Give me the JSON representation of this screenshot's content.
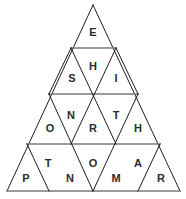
{
  "puzzle": {
    "title": "Triangle Letter Grid",
    "shape": "equilateral-triangle",
    "row_count": 4,
    "cell_count": 16,
    "colors": {
      "background": "#ffffff",
      "edge": "#1d1d1d",
      "divider": "#7a7a7a",
      "letter": "#2b2b2b"
    },
    "rows": [
      {
        "index": 1,
        "cells": [
          {
            "id": "r1c1",
            "letter": "E",
            "orientation": "up",
            "cx": 93,
            "cy": 33
          }
        ]
      },
      {
        "index": 2,
        "cells": [
          {
            "id": "r2c1",
            "letter": "S",
            "orientation": "up",
            "cx": 72,
            "cy": 79
          },
          {
            "id": "r2c2",
            "letter": "H",
            "orientation": "down",
            "cx": 93,
            "cy": 67
          },
          {
            "id": "r2c3",
            "letter": "I",
            "orientation": "up",
            "cx": 116,
            "cy": 79
          }
        ]
      },
      {
        "index": 3,
        "cells": [
          {
            "id": "r3c1",
            "letter": "O",
            "orientation": "up",
            "cx": 50,
            "cy": 129
          },
          {
            "id": "r3c2",
            "letter": "N",
            "orientation": "down",
            "cx": 71,
            "cy": 116
          },
          {
            "id": "r3c3",
            "letter": "R",
            "orientation": "up",
            "cx": 93,
            "cy": 129
          },
          {
            "id": "r3c4",
            "letter": "T",
            "orientation": "down",
            "cx": 116,
            "cy": 116
          },
          {
            "id": "r3c5",
            "letter": "H",
            "orientation": "up",
            "cx": 138,
            "cy": 129
          }
        ]
      },
      {
        "index": 4,
        "cells": [
          {
            "id": "r4c1",
            "letter": "P",
            "orientation": "up",
            "cx": 26,
            "cy": 179
          },
          {
            "id": "r4c2",
            "letter": "T",
            "orientation": "down",
            "cx": 48,
            "cy": 164
          },
          {
            "id": "r4c3",
            "letter": "N",
            "orientation": "up",
            "cx": 70,
            "cy": 179
          },
          {
            "id": "r4c4",
            "letter": "O",
            "orientation": "down",
            "cx": 93,
            "cy": 164
          },
          {
            "id": "r4c5",
            "letter": "M",
            "orientation": "up",
            "cx": 116,
            "cy": 179
          },
          {
            "id": "r4c6",
            "letter": "A",
            "orientation": "down",
            "cx": 138,
            "cy": 164
          },
          {
            "id": "r4c7",
            "letter": "R",
            "orientation": "up",
            "cx": 161,
            "cy": 179
          }
        ]
      }
    ],
    "geometry": {
      "apex": {
        "x": 93,
        "y": 5
      },
      "base_left": {
        "x": 7,
        "y": 191
      },
      "base_right": {
        "x": 180,
        "y": 191
      },
      "row_divider_y": [
        48,
        94,
        144
      ],
      "outline_path": "M 93 5 L 180 191 L 7 191 Z",
      "left_edge_path": "M 93 5 L 7 191",
      "right_edge_path": "M 93 5 L 180 191",
      "divider_paths": [
        "M 71 48 L 116 48",
        "M 49 94 L 138 94",
        "M 27 144 L 160 144"
      ],
      "left_leaning_paths": [
        "M 71 48 L 49 94",
        "M 116 48 L 71 144",
        "M 138 94 L 93 191",
        "M 160 144 L 138 191"
      ],
      "right_leaning_paths": [
        "M 116 48 L 138 94",
        "M 71 48 L 116 144",
        "M 49 94 L 93 191",
        "M 27 144 L 49 191"
      ]
    }
  }
}
